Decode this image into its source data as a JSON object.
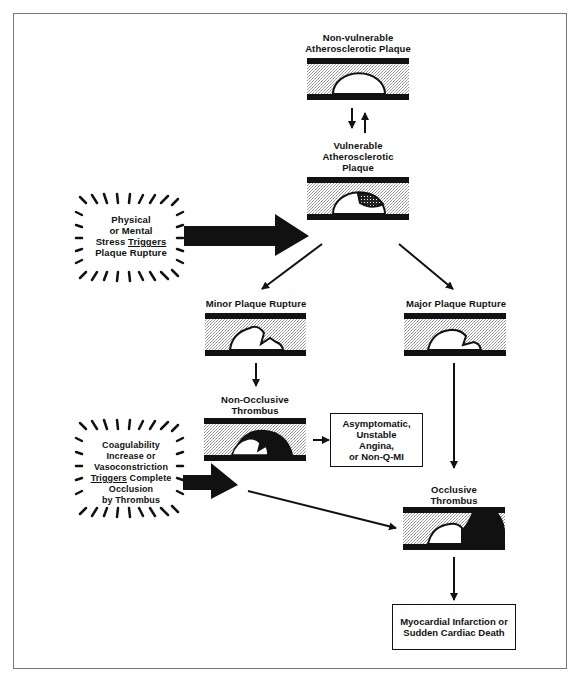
{
  "diagram": {
    "nodes": {
      "non_vulnerable": {
        "label_line1": "Non-vulnerable",
        "label_line2": "Atherosclerotic Plaque"
      },
      "vulnerable": {
        "label_line1": "Vulnerable",
        "label_line2": "Atherosclerotic",
        "label_line3": "Plaque"
      },
      "stress_trigger": {
        "line1": "Physical",
        "line2": "or Mental",
        "line3a": "Stress ",
        "line3b": "Triggers",
        "line4": "Plaque Rupture"
      },
      "minor_rupture": {
        "label": "Minor Plaque Rupture"
      },
      "major_rupture": {
        "label": "Major Plaque Rupture"
      },
      "non_occlusive": {
        "label_line1": "Non-Occlusive",
        "label_line2": "Thrombus"
      },
      "asymptomatic": {
        "line1": "Asymptomatic,",
        "line2": "Unstable",
        "line3": "Angina,",
        "line4": "or Non-Q-MI"
      },
      "coagulability_trigger": {
        "line1": "Coagulability",
        "line2": "Increase or",
        "line3": "Vasoconstriction",
        "line4a": "Triggers",
        "line4b": " Complete",
        "line5": "Occlusion",
        "line6": "by Thrombus"
      },
      "occlusive": {
        "label_line1": "Occlusive",
        "label_line2": "Thrombus"
      },
      "outcome": {
        "line1": "Myocardial Infarction or",
        "line2": "Sudden Cardiac Death"
      }
    },
    "edges": [
      {
        "from": "non_vulnerable",
        "to": "vulnerable",
        "type": "bidirectional"
      },
      {
        "from": "stress_trigger",
        "to": "vulnerable",
        "type": "thick-arrow"
      },
      {
        "from": "vulnerable",
        "to": "minor_rupture",
        "type": "arrow"
      },
      {
        "from": "vulnerable",
        "to": "major_rupture",
        "type": "arrow"
      },
      {
        "from": "minor_rupture",
        "to": "non_occlusive",
        "type": "arrow"
      },
      {
        "from": "non_occlusive",
        "to": "asymptomatic",
        "type": "arrow"
      },
      {
        "from": "major_rupture",
        "to": "occlusive",
        "type": "arrow"
      },
      {
        "from": "coagulability_trigger",
        "to": "occlusive",
        "type": "thick-arrow-plus-line"
      },
      {
        "from": "occlusive",
        "to": "outcome",
        "type": "arrow"
      }
    ],
    "colors": {
      "ink": "#111111",
      "frame": "#777777",
      "lumen_stipple": "#c8c8c8"
    }
  }
}
